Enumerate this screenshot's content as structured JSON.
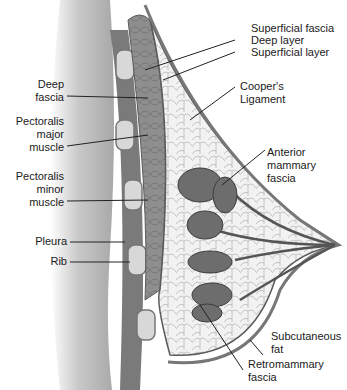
{
  "figure": {
    "style": "grayscale illustration"
  },
  "labels": {
    "superficial_fascia": "Superficial fascia",
    "deep_layer": "Deep layer",
    "superficial_layer": "Superficial layer",
    "coopers_ligament": "Cooper's\nLigament",
    "anterior_mammary_fascia": "Anterior\nmammary\nfascia",
    "subcutaneous_fat": "Subcutaneous\nfat",
    "retromammary_fascia": "Retromammary\nfascia",
    "deep_fascia": "Deep\nfascia",
    "pectoralis_major": "Pectoralis\nmajor\nmuscle",
    "pectoralis_minor": "Pectoralis\nminor\nmuscle",
    "pleura": "Pleura",
    "rib": "Rib"
  },
  "colors": {
    "chest_wall": "#b9b9b9",
    "muscle": "#8c8c8c",
    "rib": "#d6d6d6",
    "fat": "#efefef",
    "gland": "#6f6f6f",
    "outline": "#5a5a5a",
    "leader": "#222222"
  }
}
